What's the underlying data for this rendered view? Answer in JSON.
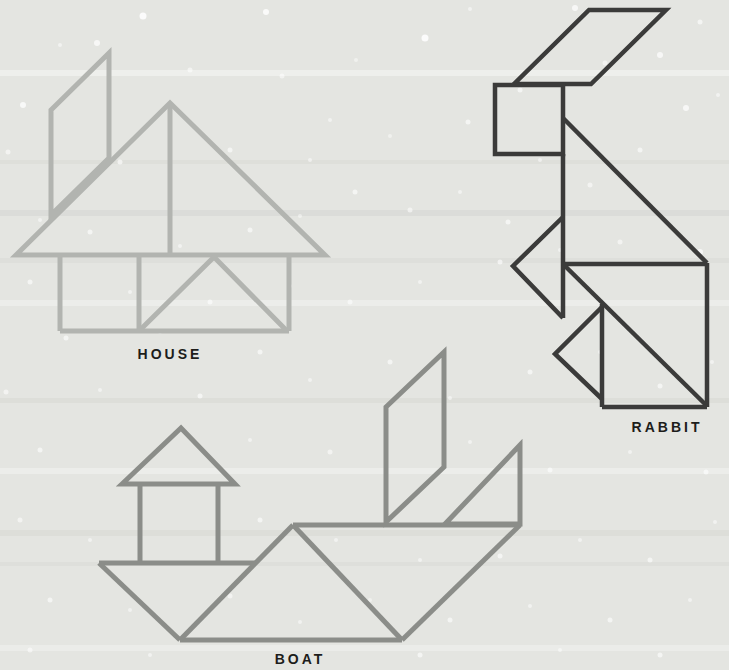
{
  "page": {
    "background_color": "#e4e5e1",
    "speck_color": "#ffffff"
  },
  "typography": {
    "label_color": "#1d1d1b"
  },
  "figures": {
    "house": {
      "label": "HOUSE",
      "stroke_color": "#b2b4b0",
      "stroke_width": "5"
    },
    "rabbit": {
      "label": "RABBIT",
      "stroke_color": "#3b3b3a",
      "stroke_width": "4.5"
    },
    "boat": {
      "label": "BOAT",
      "stroke_color": "#8b8d89",
      "stroke_width": "5"
    }
  }
}
